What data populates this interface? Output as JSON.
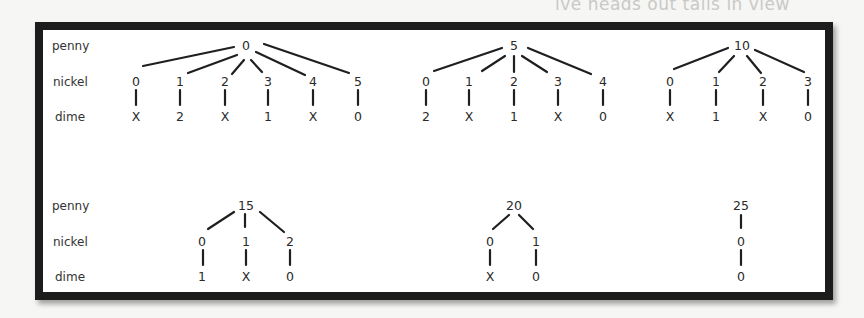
{
  "background_text": "ive heads out tails in view",
  "row_labels": [
    "penny",
    "nickel",
    "dime"
  ],
  "trees": [
    {
      "root": "0",
      "branches": [
        {
          "nickel": "0",
          "dime": "X"
        },
        {
          "nickel": "1",
          "dime": "2"
        },
        {
          "nickel": "2",
          "dime": "X"
        },
        {
          "nickel": "3",
          "dime": "1"
        },
        {
          "nickel": "4",
          "dime": "X"
        },
        {
          "nickel": "5",
          "dime": "0"
        }
      ]
    },
    {
      "root": "5",
      "branches": [
        {
          "nickel": "0",
          "dime": "2"
        },
        {
          "nickel": "1",
          "dime": "X"
        },
        {
          "nickel": "2",
          "dime": "1"
        },
        {
          "nickel": "3",
          "dime": "X"
        },
        {
          "nickel": "4",
          "dime": "0"
        }
      ]
    },
    {
      "root": "10",
      "branches": [
        {
          "nickel": "0",
          "dime": "X"
        },
        {
          "nickel": "1",
          "dime": "1"
        },
        {
          "nickel": "2",
          "dime": "X"
        },
        {
          "nickel": "3",
          "dime": "0"
        }
      ]
    },
    {
      "root": "15",
      "branches": [
        {
          "nickel": "0",
          "dime": "1"
        },
        {
          "nickel": "1",
          "dime": "X"
        },
        {
          "nickel": "2",
          "dime": "0"
        }
      ]
    },
    {
      "root": "20",
      "branches": [
        {
          "nickel": "0",
          "dime": "X"
        },
        {
          "nickel": "1",
          "dime": "0"
        }
      ]
    },
    {
      "root": "25",
      "branches": [
        {
          "nickel": "0",
          "dime": "0"
        }
      ]
    }
  ]
}
